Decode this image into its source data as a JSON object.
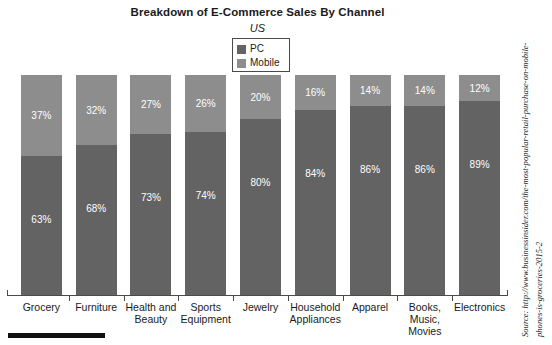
{
  "chart_data": {
    "type": "bar",
    "subtype": "100% stacked bar",
    "title": "Breakdown of E-Commerce Sales By Channel",
    "subtitle": "US",
    "xlabel": "",
    "ylabel": "",
    "ylim": [
      0,
      100
    ],
    "grid": false,
    "legend_position": "top-center",
    "categories": [
      "Grocery",
      "Furniture",
      "Health and Beauty",
      "Sports Equipment",
      "Jewelry",
      "Household Appliances",
      "Apparel",
      "Books, Music, Movies",
      "Electronics"
    ],
    "series": [
      {
        "name": "PC",
        "color": "#636363",
        "values": [
          63,
          68,
          73,
          74,
          80,
          84,
          86,
          86,
          89
        ],
        "labels": [
          "63%",
          "68%",
          "73%",
          "74%",
          "80%",
          "84%",
          "86%",
          "86%",
          "89%"
        ]
      },
      {
        "name": "Mobile",
        "color": "#8d8d8d",
        "values": [
          37,
          32,
          27,
          26,
          20,
          16,
          14,
          14,
          12
        ],
        "labels": [
          "37%",
          "32%",
          "27%",
          "26%",
          "20%",
          "16%",
          "14%",
          "14%",
          "12%"
        ]
      }
    ],
    "category_label_lines": [
      [
        "Grocery"
      ],
      [
        "Furniture"
      ],
      [
        "Health and",
        "Beauty"
      ],
      [
        "Sports",
        "Equipment"
      ],
      [
        "Jewelry"
      ],
      [
        "Household",
        "Appliances"
      ],
      [
        "Apparel"
      ],
      [
        "Books,",
        "Music,",
        "Movies"
      ],
      [
        "Electronics"
      ]
    ]
  },
  "legend": {
    "items": [
      {
        "label": "PC",
        "color": "#636363"
      },
      {
        "label": "Mobile",
        "color": "#8d8d8d"
      }
    ]
  },
  "source": {
    "line1": "Source: http://www.businessinsider.com/the-most-popular-retail-purchase-on-mobile-",
    "line2": "phones-is-groceries-2015-2"
  },
  "colors": {
    "pc": "#636363",
    "mobile": "#8d8d8d",
    "axis": "#4a4a4a",
    "background": "#ffffff",
    "text": "#1a1a1a",
    "value_label": "#ffffff"
  }
}
